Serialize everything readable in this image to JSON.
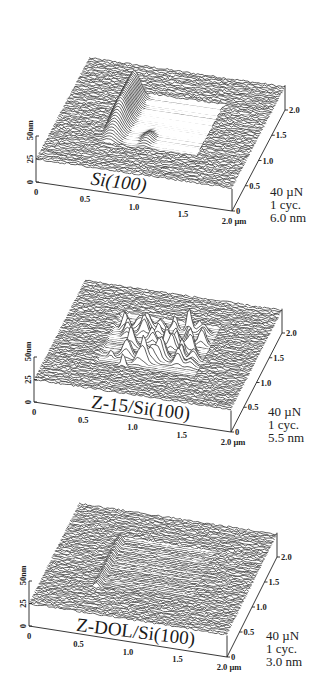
{
  "chart_data": [
    {
      "type": "surface3d",
      "title": "Si(100)",
      "title_italic": true,
      "x_axis": {
        "label_unit": "µm",
        "ticks": [
          "0",
          "0.5",
          "1.0",
          "1.5",
          "2.0"
        ],
        "range": [
          0,
          2.0
        ]
      },
      "y_axis": {
        "ticks": [
          "0",
          "0.5",
          "1.0",
          "1.5",
          "2.0"
        ],
        "range": [
          0,
          2.0
        ]
      },
      "z_axis": {
        "label_unit": "nm",
        "ticks": [
          "0",
          "25",
          "50"
        ],
        "range": [
          0,
          50
        ]
      },
      "annotations": [
        "40 µN",
        "1 cyc.",
        "6.0 nm"
      ],
      "wear_scar": {
        "x_range": [
          0.5,
          1.5
        ],
        "y_range": [
          0.5,
          1.5
        ],
        "feature": "single large debris ridge along left edge",
        "peak_height_nm": 27,
        "roughness_nm": 1.0
      }
    },
    {
      "type": "surface3d",
      "title": "Z-15/Si(100)",
      "title_italic": false,
      "x_axis": {
        "label_unit": "µm",
        "ticks": [
          "0",
          "0.5",
          "1.0",
          "1.5",
          "2.0"
        ],
        "range": [
          0,
          2.0
        ]
      },
      "y_axis": {
        "ticks": [
          "0",
          "0.5",
          "1.0",
          "1.5",
          "2.0"
        ],
        "range": [
          0,
          2.0
        ]
      },
      "z_axis": {
        "label_unit": "nm",
        "ticks": [
          "0",
          "25",
          "50"
        ],
        "range": [
          0,
          50
        ]
      },
      "annotations": [
        "40 µN",
        "1 cyc.",
        "5.5 nm"
      ],
      "wear_scar": {
        "x_range": [
          0.5,
          1.5
        ],
        "y_range": [
          0.5,
          1.5
        ],
        "feature": "many sharp debris peaks across scar",
        "peak_height_nm": 22,
        "roughness_nm": 1.0
      }
    },
    {
      "type": "surface3d",
      "title": "Z-DOL/Si(100)",
      "title_italic": false,
      "x_axis": {
        "label_unit": "µm",
        "ticks": [
          "0",
          "0.5",
          "1.0",
          "1.5",
          "2.0"
        ],
        "range": [
          0,
          2.0
        ]
      },
      "y_axis": {
        "ticks": [
          "0",
          "0.5",
          "1.0",
          "1.5",
          "2.0"
        ],
        "range": [
          0,
          2.0
        ]
      },
      "z_axis": {
        "label_unit": "nm",
        "ticks": [
          "0",
          "25",
          "50"
        ],
        "range": [
          0,
          50
        ]
      },
      "annotations": [
        "40 µN",
        "1 cyc.",
        "3.0 nm"
      ],
      "wear_scar": {
        "x_range": [
          0.5,
          1.5
        ],
        "y_range": [
          0.5,
          1.5
        ],
        "feature": "faint scar outline, minimal debris",
        "peak_height_nm": 6,
        "roughness_nm": 1.0
      }
    }
  ]
}
